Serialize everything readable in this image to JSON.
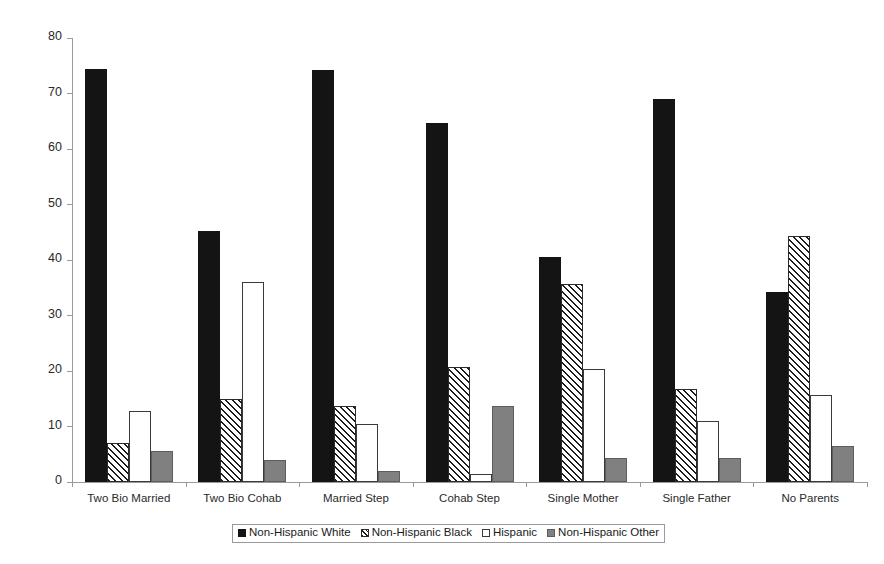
{
  "chart_data": {
    "type": "bar",
    "title": "",
    "subtitle": "",
    "xlabel": "",
    "ylabel": "",
    "ylim": [
      0,
      80
    ],
    "yticks": [
      0,
      10,
      20,
      30,
      40,
      50,
      60,
      70,
      80
    ],
    "grid": false,
    "legend_position": "bottom",
    "categories": [
      "Two Bio Married",
      "Two Bio Cohab",
      "Married Step",
      "Cohab Step",
      "Single Mother",
      "Single Father",
      "No Parents"
    ],
    "series": [
      {
        "name": "Non-Hispanic White",
        "pattern": "solid-black",
        "color": "#141414",
        "values": [
          74.5,
          45.3,
          74.2,
          64.6,
          40.6,
          69.0,
          34.3
        ]
      },
      {
        "name": "Non-Hispanic Black",
        "pattern": "diagonal-hatch",
        "color": "#ffffff",
        "values": [
          7.0,
          15.0,
          13.7,
          20.8,
          35.6,
          16.8,
          44.4
        ]
      },
      {
        "name": "Hispanic",
        "pattern": "hollow-white",
        "color": "#ffffff",
        "values": [
          12.8,
          36.0,
          10.5,
          1.5,
          20.4,
          11.0,
          15.7
        ]
      },
      {
        "name": "Non-Hispanic Other",
        "pattern": "solid-gray",
        "color": "#808080",
        "values": [
          5.6,
          4.0,
          2.0,
          13.7,
          4.3,
          4.3,
          6.5
        ]
      }
    ]
  },
  "axis": {
    "y_tick_labels": [
      "0",
      "10",
      "20",
      "30",
      "40",
      "50",
      "60",
      "70",
      "80"
    ]
  },
  "legend": {
    "entries": [
      "Non-Hispanic White",
      "Non-Hispanic Black",
      "Hispanic",
      "Non-Hispanic Other"
    ]
  }
}
